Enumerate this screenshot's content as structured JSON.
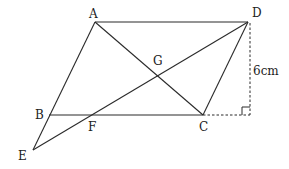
{
  "diagram": {
    "type": "geometry",
    "stroke_color": "#2a2a2a",
    "points": {
      "A": {
        "label": "A",
        "x": 95,
        "y": 22,
        "lx": 89,
        "ly": 18
      },
      "D": {
        "label": "D",
        "x": 248,
        "y": 22,
        "lx": 252,
        "ly": 17
      },
      "B": {
        "label": "B",
        "x": 49,
        "y": 115,
        "lx": 35,
        "ly": 119
      },
      "C": {
        "label": "C",
        "x": 203,
        "y": 115,
        "lx": 199,
        "ly": 131
      },
      "E": {
        "label": "E",
        "x": 33,
        "y": 150,
        "lx": 18,
        "ly": 160
      },
      "G": {
        "label": "G",
        "x": 158,
        "y": 78,
        "lx": 153,
        "ly": 65
      },
      "F": {
        "label": "F",
        "x": 90,
        "y": 115,
        "lx": 88,
        "ly": 131
      }
    },
    "segments": [
      {
        "from": "A",
        "to": "D"
      },
      {
        "from": "A",
        "to": "E"
      },
      {
        "from": "A",
        "to": "C"
      },
      {
        "from": "B",
        "to": "C"
      },
      {
        "from": "D",
        "to": "C"
      },
      {
        "from": "D",
        "to": "E"
      }
    ],
    "dashed_segments": [
      {
        "x1": 250,
        "y1": 23,
        "x2": 250,
        "y2": 115
      },
      {
        "x1": 203,
        "y1": 115,
        "x2": 250,
        "y2": 115
      }
    ],
    "right_angle_marker": {
      "x": 250,
      "y": 115,
      "size": 8
    },
    "measurement": {
      "label": "6cm",
      "x": 253,
      "y": 75
    }
  }
}
